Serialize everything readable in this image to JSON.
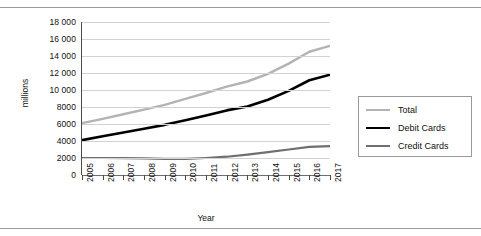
{
  "chart_data": {
    "type": "line",
    "title": "",
    "xlabel": "Year",
    "ylabel": "millions",
    "ylim": [
      0,
      18000
    ],
    "ytick_labels": [
      "18 000",
      "16 000",
      "14 000",
      "12 000",
      "10 000",
      "8000",
      "6000",
      "4000",
      "2000",
      "0"
    ],
    "ytick_values": [
      18000,
      16000,
      14000,
      12000,
      10000,
      8000,
      6000,
      4000,
      2000,
      0
    ],
    "grid": true,
    "legend_position": "right",
    "categories": [
      "2005",
      "2006",
      "2007",
      "2008",
      "2009",
      "2010",
      "2011",
      "2012",
      "2013",
      "2014",
      "2015",
      "2016",
      "2017"
    ],
    "x": [
      2005,
      2006,
      2007,
      2008,
      2009,
      2010,
      2011,
      2012,
      2013,
      2014,
      2015,
      2016,
      2017
    ],
    "series": [
      {
        "name": "Total",
        "color": "#b3b3b3",
        "width": 2.4,
        "values": [
          6100,
          6600,
          7150,
          7700,
          8250,
          8950,
          9650,
          10400,
          11000,
          11900,
          13100,
          14500,
          15200
        ]
      },
      {
        "name": "Debit Cards",
        "color": "#000000",
        "width": 2.6,
        "values": [
          4100,
          4550,
          5000,
          5450,
          5900,
          6450,
          7000,
          7600,
          8050,
          8850,
          9900,
          11150,
          11800
        ]
      },
      {
        "name": "Credit Cards",
        "color": "#6f6f6f",
        "width": 2.2,
        "values": [
          2000,
          2000,
          1980,
          1950,
          1900,
          1900,
          2000,
          2150,
          2400,
          2700,
          3000,
          3300,
          3400
        ]
      }
    ]
  },
  "legend": {
    "items": [
      {
        "label": "Total"
      },
      {
        "label": "Debit Cards"
      },
      {
        "label": "Credit Cards"
      }
    ]
  },
  "axes": {
    "x_title": "Year",
    "y_title": "millions"
  }
}
